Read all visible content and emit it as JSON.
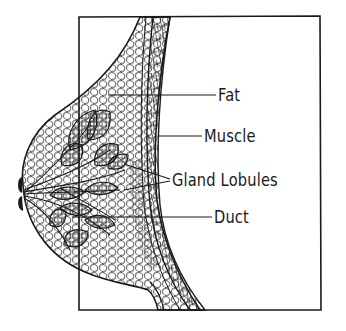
{
  "figure": {
    "colors": {
      "ink": "#1a1a1a",
      "background": "#ffffff"
    },
    "labels": [
      {
        "id": "fat",
        "text": "Fat"
      },
      {
        "id": "muscle",
        "text": "Muscle"
      },
      {
        "id": "gland-lobules",
        "text": "Gland Lobules"
      },
      {
        "id": "duct",
        "text": "Duct"
      }
    ]
  }
}
